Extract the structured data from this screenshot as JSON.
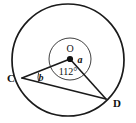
{
  "figure": {
    "type": "circle-geometry-diagram",
    "background_color": "#ffffff",
    "stroke_color": "#1a1a1a",
    "label_color": "#111111"
  },
  "circle": {
    "name": "main-circle",
    "center_x": 68,
    "center_y": 60,
    "radius": 56,
    "stroke_width": 1.6
  },
  "inner_arc_circle": {
    "name": "angle-mark-circle",
    "center_x": 70,
    "center_y": 59,
    "radius": 21,
    "stroke_width": 1.0
  },
  "points": {
    "center": {
      "label": "O",
      "x": 70,
      "y": 59,
      "label_x": 70,
      "label_y": 52,
      "dot_radius": 3.1
    },
    "c": {
      "label": "C",
      "x": 22,
      "y": 78,
      "label_x": 11,
      "label_y": 82
    },
    "d": {
      "label": "D",
      "x": 106,
      "y": 99,
      "label_x": 116,
      "label_y": 107
    }
  },
  "segments": [
    {
      "name": "radius-oc",
      "from": "O",
      "to": "C",
      "x1": 70,
      "y1": 59,
      "x2": 22,
      "y2": 78
    },
    {
      "name": "radius-od",
      "from": "O",
      "to": "D",
      "x1": 70,
      "y1": 59,
      "x2": 106,
      "y2": 99
    },
    {
      "name": "chord-cd",
      "from": "C",
      "to": "D",
      "x1": 22,
      "y1": 78,
      "x2": 106,
      "y2": 99
    }
  ],
  "angles": [
    {
      "name": "angle-a-at-centre",
      "label": "a",
      "vertex": "O",
      "label_x": 80,
      "label_y": 63,
      "italic": true,
      "description": "angle at centre on the right side between the two radii"
    },
    {
      "name": "angle-112-reflex-at-centre",
      "label": "112°",
      "vertex": "O",
      "value": 112,
      "unit": "degrees",
      "label_x": 68,
      "label_y": 74,
      "italic": false,
      "description": "marked angle COD measuring 112 degrees inside the small arc circle"
    },
    {
      "name": "angle-b-at-c",
      "label": "b",
      "vertex": "C",
      "label_x": 41,
      "label_y": 80,
      "italic": true,
      "arc": {
        "cx": 22,
        "cy": 78,
        "radius": 17
      },
      "description": "angle OCD at vertex C between chord CD and radius CO"
    }
  ]
}
